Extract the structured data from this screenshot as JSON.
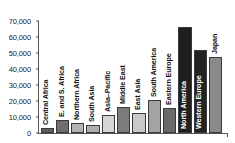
{
  "chart_data": {
    "type": "bar",
    "title": "",
    "subtitle": "",
    "xlabel": "",
    "ylabel": "",
    "grid": false,
    "legend": "none",
    "ylim": [
      0,
      70000
    ],
    "ytick_values": [
      0,
      10000,
      20000,
      30000,
      40000,
      50000,
      60000,
      70000
    ],
    "ytick_labels": [
      "0",
      "10,000",
      "20,000",
      "30,000",
      "40,000",
      "50,000",
      "60,000",
      "70,000"
    ],
    "categories": [
      "Central Africa",
      "E. and S. Africa",
      "Northern Africa",
      "South Asia",
      "Asia–Pacific",
      "Middle East",
      "East Asia",
      "South America",
      "Eastern Europe",
      "North America",
      "Western Europe",
      "Japan"
    ],
    "values": [
      3000,
      8000,
      6000,
      5000,
      11000,
      16500,
      12500,
      20500,
      15500,
      66000,
      52000,
      47500
    ],
    "bar_colors": [
      "#5d5d5d",
      "#6e6e6e",
      "#b4b4b4",
      "#aeaeae",
      "#d6d6d6",
      "#7b7b7b",
      "#c9c9c9",
      "#a3a3a3",
      "#6a6a6a",
      "#1f1f1f",
      "#232323",
      "#8a8a8a"
    ],
    "label_on_bar": [
      false,
      false,
      false,
      false,
      false,
      false,
      false,
      false,
      false,
      true,
      true,
      false
    ]
  }
}
